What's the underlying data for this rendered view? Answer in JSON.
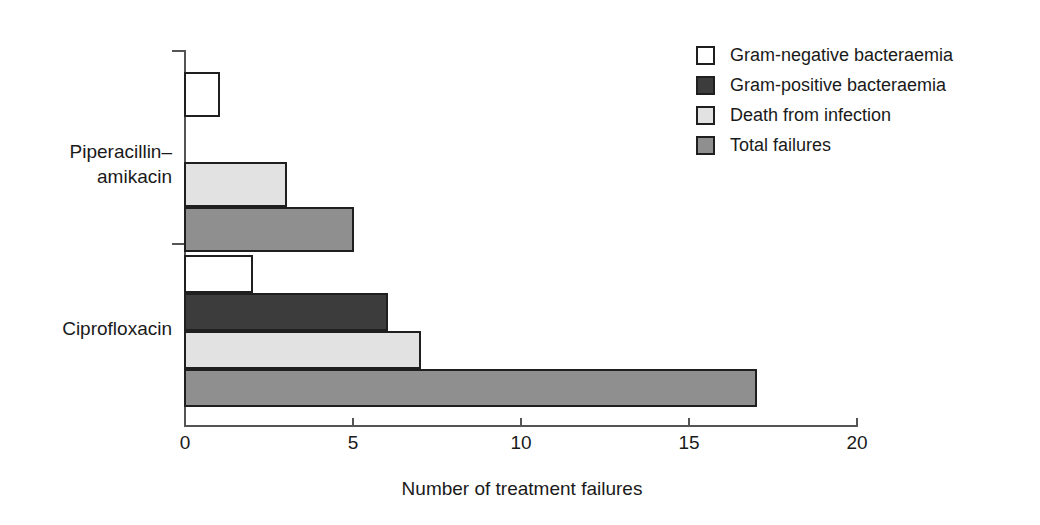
{
  "chart_data": {
    "type": "bar",
    "orientation": "horizontal",
    "title": "",
    "xlabel": "Number of treatment failures",
    "ylabel": "",
    "xlim": [
      0,
      20
    ],
    "xticks": [
      0,
      5,
      10,
      15,
      20
    ],
    "xtick_labels": [
      "0",
      "5",
      "10",
      "15",
      "20"
    ],
    "grid": false,
    "legend_position": "top-right",
    "categories": [
      "Piperacillin–\namikacin",
      "Ciprofloxacin"
    ],
    "series": [
      {
        "name": "Gram-negative bacteraemia",
        "swatch": "white",
        "color": "#ffffff",
        "values": [
          1,
          2
        ]
      },
      {
        "name": "Gram-positive bacteraemia",
        "swatch": "dark",
        "color": "#3c3c3c",
        "values": [
          0,
          6
        ]
      },
      {
        "name": "Death from infection",
        "swatch": "light",
        "color": "#e2e2e2",
        "values": [
          3,
          7
        ]
      },
      {
        "name": "Total failures",
        "swatch": "medium",
        "color": "#8f8f8f",
        "values": [
          5,
          17
        ]
      }
    ]
  },
  "axis": {
    "x_title": "Number of treatment failures",
    "tick_labels": [
      "0",
      "5",
      "10",
      "15",
      "20"
    ]
  },
  "categories": [
    {
      "label": "Piperacillin–\namikacin"
    },
    {
      "label": "Ciprofloxacin"
    }
  ],
  "legend": {
    "items": [
      {
        "label": "Gram-negative bacteraemia",
        "swatch": "white"
      },
      {
        "label": "Gram-positive bacteraemia",
        "swatch": "dark"
      },
      {
        "label": "Death from infection",
        "swatch": "light"
      },
      {
        "label": "Total failures",
        "swatch": "medium"
      }
    ]
  },
  "colors": {
    "gram_negative": "#ffffff",
    "gram_positive": "#3c3c3c",
    "death_from_infection": "#e2e2e2",
    "total_failures": "#8f8f8f",
    "outline": "#1f1f1f",
    "axis": "#555555"
  }
}
